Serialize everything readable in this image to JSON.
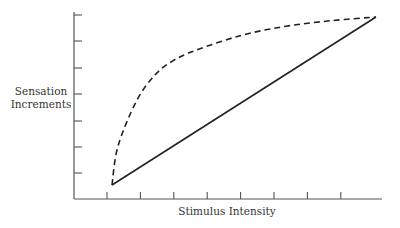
{
  "chart_data": {
    "type": "line",
    "title": "",
    "xlabel": "Stimulus Intensity",
    "ylabel_lines": [
      "Sensation",
      "Increments"
    ],
    "ylabel": "Sensation Increments",
    "x_ticks": 8,
    "y_ticks": 7,
    "tick_labels": false,
    "grid": false,
    "legend": false,
    "series": [
      {
        "name": "linear",
        "style": "solid",
        "color": "#222222",
        "points": [
          [
            0.12,
            0.07
          ],
          [
            1.0,
            0.98
          ]
        ]
      },
      {
        "name": "curved",
        "style": "dashed",
        "color": "#222222",
        "points": [
          [
            0.12,
            0.07
          ],
          [
            0.14,
            0.28
          ],
          [
            0.2,
            0.52
          ],
          [
            0.26,
            0.66
          ],
          [
            0.32,
            0.74
          ],
          [
            0.4,
            0.8
          ],
          [
            0.55,
            0.88
          ],
          [
            0.7,
            0.93
          ],
          [
            0.85,
            0.96
          ],
          [
            1.0,
            0.98
          ]
        ]
      }
    ]
  }
}
